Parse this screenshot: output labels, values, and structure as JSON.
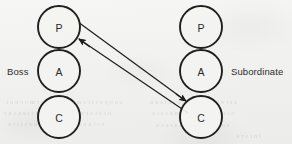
{
  "figure": {
    "type": "transactional-analysis-diagram",
    "canvas": {
      "width": 292,
      "height": 144
    },
    "background_color": "#f3f3f1",
    "ink_color": "#201f1d"
  },
  "labels": {
    "left_party": "Boss",
    "right_party": "Subordinate"
  },
  "columns": [
    {
      "id": "left",
      "party": "Boss",
      "center_x": 59,
      "states": [
        {
          "code": "P",
          "name": "parent-ego-state",
          "center_y": 27,
          "radius": 21
        },
        {
          "code": "A",
          "name": "adult-ego-state",
          "center_y": 71,
          "radius": 21
        },
        {
          "code": "C",
          "name": "child-ego-state",
          "center_y": 117,
          "radius": 21
        }
      ]
    },
    {
      "id": "right",
      "party": "Subordinate",
      "center_x": 201,
      "states": [
        {
          "code": "P",
          "name": "parent-ego-state",
          "center_y": 27,
          "radius": 21
        },
        {
          "code": "A",
          "name": "adult-ego-state",
          "center_y": 71,
          "radius": 21
        },
        {
          "code": "C",
          "name": "child-ego-state",
          "center_y": 117,
          "radius": 21
        }
      ]
    }
  ],
  "transactions": [
    {
      "name": "stimulus-arrow",
      "from": "left-P",
      "to": "right-C",
      "from_point": [
        78,
        22
      ],
      "to_point": [
        186,
        101
      ],
      "arrowhead_at": "to"
    },
    {
      "name": "response-arrow",
      "from": "right-C",
      "to": "left-P",
      "from_point": [
        188,
        113
      ],
      "to_point": [
        79,
        39
      ],
      "arrowhead_at": "to"
    }
  ],
  "ghost_text": {
    "note": "faint illegible show-through from reverse side of scanned page",
    "lines": [
      {
        "text": "a u o p e r i t o  m a n i  s o t l e r m o  c u n t",
        "left": 6,
        "top": 99
      },
      {
        "text": "n r e t o  r a n e  o n e  t s i u  r i t e  s o n r",
        "left": 4,
        "top": 110
      },
      {
        "text": "t o  i n  s o r t e  n e  a  t i  o n e  s t i r e",
        "left": 8,
        "top": 121
      },
      {
        "text": "a s  t o  m e r i n  t o  o n  r e t  s u n",
        "left": 150,
        "top": 99
      },
      {
        "text": "o r t  m a n  t i e  s o n  u n  r a t e",
        "left": 152,
        "top": 110
      },
      {
        "text": "s e n t  r o  o n  t i  m a  r e  s o",
        "left": 156,
        "top": 122
      },
      {
        "text": "i n  t o  r e",
        "left": 236,
        "top": 133
      }
    ]
  }
}
